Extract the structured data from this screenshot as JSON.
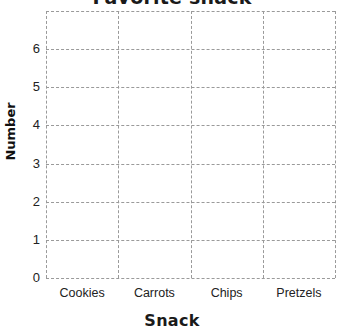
{
  "chart_data": {
    "type": "bar",
    "title": "Favorite snack",
    "title_truncated": true,
    "xlabel": "Snack",
    "ylabel": "Number",
    "categories": [
      "Cookies",
      "Carrots",
      "Chips",
      "Pretzels"
    ],
    "values": [
      null,
      null,
      null,
      null
    ],
    "ylim": [
      0,
      7
    ],
    "yticks": [
      "0",
      "1",
      "2",
      "3",
      "4",
      "5",
      "6"
    ],
    "grid": "dashed",
    "legend": "none",
    "note": "Empty grid template - no bars drawn",
    "colors": {
      "grid": "#9a9a9a",
      "text": "#222222",
      "background": "#ffffff"
    }
  }
}
